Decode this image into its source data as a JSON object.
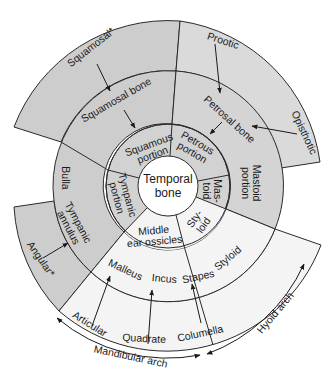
{
  "colors": {
    "shaded": "#cdcdcd",
    "light": "#f2f2f2",
    "center": "#ffffff",
    "line": "#2a2a2a"
  },
  "center": {
    "line1": "Temporal",
    "line2": "bone"
  },
  "inner_ring": {
    "squamous": [
      "Squamous",
      "portion"
    ],
    "petrous": [
      "Petrous",
      "portion"
    ],
    "mastoid": [
      "Mas-",
      "toid"
    ],
    "styloid": [
      "Sty-",
      "loid"
    ],
    "middle_ear": [
      "Middle",
      "ear ossicles"
    ],
    "tympanic": [
      "Tympanic",
      "portion"
    ]
  },
  "middle_ring": {
    "squamosal_bone": "Squamosal bone",
    "petrosal_bone": "Petrosal bone",
    "mastoid_portion": [
      "Mastoid",
      "portion"
    ],
    "styloid": "Styloid",
    "malleus": "Malleus",
    "incus": "Incus",
    "stapes": "Stapes",
    "tympanic_annulus": [
      "Tympanic",
      "annulus"
    ],
    "bulla": "Bulla"
  },
  "outer_ring": {
    "squamosal": "Squamosal*",
    "prootic": "Prootic",
    "opisthotic": "Opisthotic",
    "angular": "Angular*",
    "articular": "Articular",
    "quadrate": "Quadrate",
    "columella": "Columella"
  },
  "arches": {
    "mandibular": "Mandibular arch",
    "hyoid": "Hyoid arch"
  }
}
